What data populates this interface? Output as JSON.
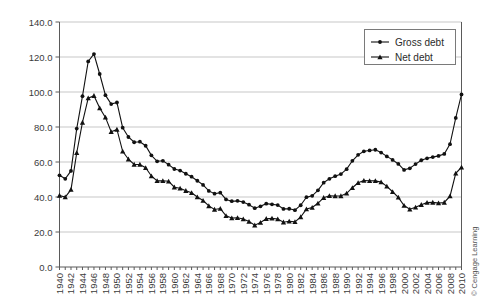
{
  "credit": "© Cengage Learning",
  "legend": {
    "position": "top-right",
    "entries": [
      {
        "label": "Gross debt",
        "marker": "diamond-dot-icon",
        "color": "#111111"
      },
      {
        "label": "Net debt",
        "marker": "triangle-dot-icon",
        "color": "#111111"
      }
    ]
  },
  "axes": {
    "y": {
      "ticks": [
        "0.0",
        "20.0",
        "40.0",
        "60.0",
        "80.0",
        "100.0",
        "120.0",
        "140.0"
      ],
      "min": 0,
      "max": 140,
      "step": 20,
      "label": ""
    },
    "x": {
      "label": "",
      "min": 1940,
      "max": 2010,
      "tick_step": 2,
      "ticks": [
        "1940",
        "1942",
        "1944",
        "1946",
        "1948",
        "1950",
        "1952",
        "1954",
        "1956",
        "1958",
        "1960",
        "1962",
        "1964",
        "1966",
        "1968",
        "1970",
        "1972",
        "1974",
        "1976",
        "1978",
        "1980",
        "1982",
        "1984",
        "1986",
        "1988",
        "1990",
        "1992",
        "1994",
        "1996",
        "1998",
        "2000",
        "2002",
        "2004",
        "2006",
        "2008",
        "2010"
      ]
    }
  },
  "chart_data": {
    "type": "line",
    "title": "",
    "subtitle": "",
    "xlabel": "",
    "ylabel": "",
    "xlim": [
      1940,
      2010
    ],
    "ylim": [
      0,
      140
    ],
    "grid": true,
    "legend_position": "top-right",
    "x": [
      1940,
      1941,
      1942,
      1943,
      1944,
      1945,
      1946,
      1947,
      1948,
      1949,
      1950,
      1951,
      1952,
      1953,
      1954,
      1955,
      1956,
      1957,
      1958,
      1959,
      1960,
      1961,
      1962,
      1963,
      1964,
      1965,
      1966,
      1967,
      1968,
      1969,
      1970,
      1971,
      1972,
      1973,
      1974,
      1975,
      1976,
      1977,
      1978,
      1979,
      1980,
      1981,
      1982,
      1983,
      1984,
      1985,
      1986,
      1987,
      1988,
      1989,
      1990,
      1991,
      1992,
      1993,
      1994,
      1995,
      1996,
      1997,
      1998,
      1999,
      2000,
      2001,
      2002,
      2003,
      2004,
      2005,
      2006,
      2007,
      2008,
      2009,
      2010
    ],
    "series": [
      {
        "name": "Gross debt",
        "marker": "diamond",
        "color": "#111111",
        "values": [
          52.4,
          50.4,
          54.9,
          79.1,
          97.6,
          117.5,
          121.7,
          110.3,
          98.2,
          93.1,
          94.0,
          79.6,
          74.3,
          71.3,
          71.6,
          69.3,
          63.8,
          60.4,
          60.7,
          58.5,
          56.0,
          55.1,
          53.3,
          51.6,
          49.3,
          46.9,
          43.5,
          41.9,
          42.5,
          38.6,
          37.6,
          37.8,
          37.1,
          35.6,
          33.6,
          34.7,
          36.2,
          35.8,
          35.4,
          33.2,
          33.3,
          32.5,
          35.3,
          39.9,
          40.7,
          43.8,
          48.2,
          50.4,
          51.9,
          53.1,
          55.9,
          60.7,
          64.1,
          66.1,
          66.6,
          67.0,
          65.4,
          63.2,
          61.2,
          58.9,
          55.5,
          56.4,
          58.8,
          61.0,
          62.1,
          62.8,
          63.5,
          64.6,
          70.2,
          85.2,
          98.6
        ]
      },
      {
        "name": "Net debt",
        "marker": "triangle",
        "color": "#111111",
        "values": [
          40.9,
          40.0,
          44.2,
          65.3,
          82.6,
          96.5,
          97.9,
          90.8,
          85.5,
          77.3,
          78.6,
          66.1,
          61.6,
          58.6,
          58.6,
          56.7,
          52.0,
          49.2,
          49.3,
          49.0,
          45.6,
          45.0,
          43.6,
          42.4,
          40.0,
          38.0,
          34.9,
          32.9,
          33.4,
          29.3,
          28.0,
          28.1,
          27.4,
          26.0,
          23.9,
          25.4,
          27.6,
          27.8,
          27.4,
          25.6,
          26.1,
          25.8,
          28.6,
          33.1,
          34.0,
          36.4,
          39.6,
          40.7,
          40.6,
          40.6,
          42.1,
          45.3,
          48.1,
          49.4,
          49.3,
          49.2,
          48.5,
          46.1,
          43.0,
          39.8,
          35.1,
          33.0,
          34.1,
          35.6,
          36.8,
          36.9,
          36.5,
          36.9,
          40.5,
          53.5,
          57.0
        ]
      }
    ]
  }
}
